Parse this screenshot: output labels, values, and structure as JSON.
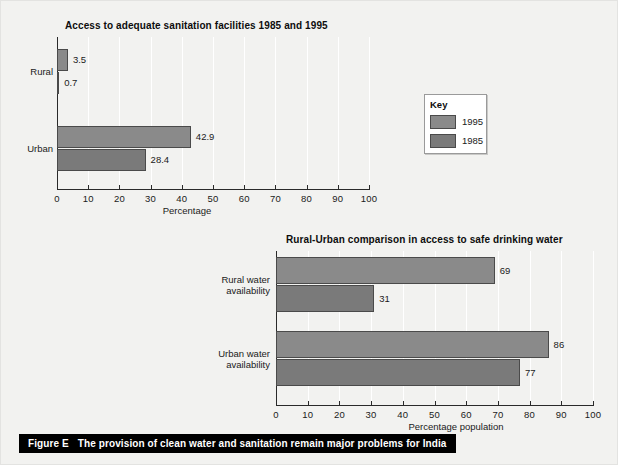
{
  "caption": {
    "figure_label": "Figure E",
    "text": "The provision of clean water and sanitation remain major problems for India"
  },
  "key": {
    "title": "Key",
    "items": [
      {
        "label": "1995",
        "color": "#8a8a8a"
      },
      {
        "label": "1985",
        "color": "#7a7a7a"
      }
    ]
  },
  "chart_data": [
    {
      "id": "sanitation",
      "type": "bar",
      "orientation": "horizontal",
      "title": "Access to adequate sanitation facilities 1985 and 1995",
      "xlabel": "Percentage",
      "ylabel": "",
      "xlim": [
        0,
        100
      ],
      "xticks": [
        "0",
        "10",
        "20",
        "30",
        "40",
        "50",
        "60",
        "70",
        "80",
        "90",
        "100"
      ],
      "grid": true,
      "categories": [
        "Rural",
        "Urban"
      ],
      "legend_position": "external-right",
      "series": [
        {
          "name": "1995",
          "color": "#8a8a8a",
          "values": [
            3.5,
            42.9
          ],
          "labels": [
            "3.5",
            "42.9"
          ]
        },
        {
          "name": "1985",
          "color": "#7a7a7a",
          "values": [
            0.7,
            28.4
          ],
          "labels": [
            "0.7",
            "28.4"
          ]
        }
      ]
    },
    {
      "id": "drinking-water",
      "type": "bar",
      "orientation": "horizontal",
      "title": "Rural-Urban comparison in access to safe drinking water",
      "xlabel": "Percentage population",
      "ylabel": "",
      "xlim": [
        0,
        100
      ],
      "xticks": [
        "0",
        "10",
        "20",
        "30",
        "40",
        "50",
        "60",
        "70",
        "80",
        "90",
        "100"
      ],
      "grid": true,
      "categories": [
        "Rural water availability",
        "Urban water availability"
      ],
      "category_lines": [
        [
          "Rural water",
          "availability"
        ],
        [
          "Urban water",
          "availability"
        ]
      ],
      "legend_position": "none",
      "series": [
        {
          "name": "1995",
          "color": "#8a8a8a",
          "values": [
            69,
            86
          ],
          "labels": [
            "69",
            "86"
          ]
        },
        {
          "name": "1985",
          "color": "#7a7a7a",
          "values": [
            31,
            77
          ],
          "labels": [
            "31",
            "77"
          ]
        }
      ]
    }
  ]
}
